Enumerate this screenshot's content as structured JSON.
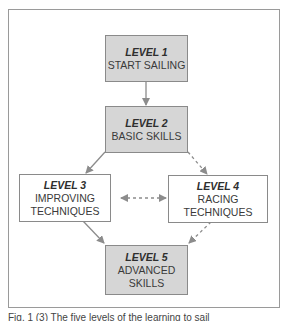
{
  "diagram": {
    "nodes": [
      {
        "id": "level1",
        "level": "LEVEL 1",
        "lines": [
          "START SAILING"
        ],
        "fill": "#d6d6d6"
      },
      {
        "id": "level2",
        "level": "LEVEL 2",
        "lines": [
          "BASIC SKILLS"
        ],
        "fill": "#d6d6d6"
      },
      {
        "id": "level3",
        "level": "LEVEL 3",
        "lines": [
          "IMPROVING",
          "TECHNIQUES"
        ],
        "fill": "#ffffff"
      },
      {
        "id": "level4",
        "level": "LEVEL 4",
        "lines": [
          "RACING",
          "TECHNIQUES"
        ],
        "fill": "#ffffff"
      },
      {
        "id": "level5",
        "level": "LEVEL 5",
        "lines": [
          "ADVANCED",
          "SKILLS"
        ],
        "fill": "#d6d6d6"
      }
    ],
    "edges": [
      {
        "from": "level1",
        "to": "level2",
        "style": "solid"
      },
      {
        "from": "level2",
        "to": "level3",
        "style": "solid"
      },
      {
        "from": "level2",
        "to": "level4",
        "style": "dashed"
      },
      {
        "from": "level3",
        "to": "level4",
        "style": "dashed",
        "bidirectional": true
      },
      {
        "from": "level3",
        "to": "level5",
        "style": "solid"
      },
      {
        "from": "level4",
        "to": "level5",
        "style": "dashed"
      }
    ],
    "colors": {
      "box_fill": "#d6d6d6",
      "border": "#8a8a8a",
      "arrow": "#8c8c8c",
      "text": "#3a3a3a"
    }
  },
  "caption": "Fig. 1 (3) The five levels of the learning to sail"
}
